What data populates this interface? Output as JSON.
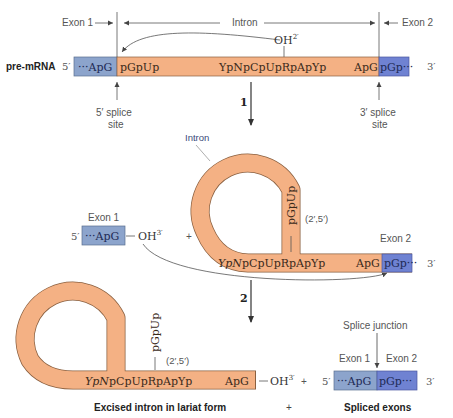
{
  "colors": {
    "exon1": "#8ca4cc",
    "exon2": "#6f82d2",
    "intron": "#f4b184",
    "outline": "#6b4a30",
    "line": "#555555"
  },
  "top": {
    "row_label": "pre-mRNA",
    "five_prime": "5′",
    "three_prime": "3′",
    "exon1_label": "Exon 1",
    "intron_label": "Intron",
    "exon2_label": "Exon 2",
    "exon1_seq": "···ApG",
    "intron_start_seq": "pGpUp",
    "branch_seq": "YpNpCpUpRpApYp",
    "intron_end_seq": "ApG",
    "exon2_seq": "pGp···",
    "oh_label": "OH",
    "oh_sup": "2′",
    "five_splice_site": [
      "5′ splice",
      "site"
    ],
    "three_splice_site": [
      "3′ splice",
      "site"
    ]
  },
  "step1": {
    "label": "1"
  },
  "middle": {
    "intron_label": "Intron",
    "exon1_label": "Exon 1",
    "exon2_label": "Exon 2",
    "five_prime": "5′",
    "three_prime": "3′",
    "exon1_seq": "···ApG",
    "oh_label": "OH",
    "oh_sup": "3′",
    "plus": "+",
    "loop_seq": "pGpUp",
    "linkage": "(2′,5′)",
    "branch_seq_italic": "YpN",
    "branch_seq_rest": "pCpUpRpApYp",
    "intron_end_seq": "ApG",
    "exon2_seq": "pGp···"
  },
  "step2": {
    "label": "2"
  },
  "bottom": {
    "loop_seq": "pGpUp",
    "linkage": "(2′,5′)",
    "branch_seq_italic": "YpN",
    "branch_seq_rest": "pCpUpRpApYp",
    "intron_end_seq": "ApG",
    "oh_label": "OH",
    "oh_sup": "3′",
    "plus": "+",
    "splice_junction": "Splice junction",
    "exon1_label": "Exon 1",
    "exon2_label": "Exon 2",
    "five_prime": "5′",
    "three_prime": "3′",
    "exon1_seq": "···ApG",
    "exon2_seq": "pGp···",
    "caption_left": "Excised intron in lariat form",
    "caption_plus": "+",
    "caption_right": "Spliced exons"
  }
}
